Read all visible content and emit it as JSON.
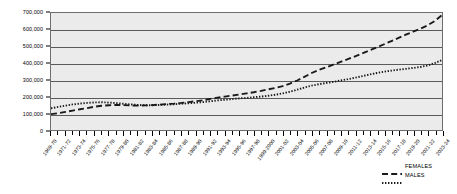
{
  "chart_data": {
    "type": "line",
    "title": "",
    "xlabel": "",
    "ylabel": "",
    "ylim": [
      0,
      700000
    ],
    "ytick_labels": [
      "0",
      "100,000",
      "200,000",
      "300,000",
      "400,000",
      "500,000",
      "600,000",
      "700,000"
    ],
    "ytick_values": [
      0,
      100000,
      200000,
      300000,
      400000,
      500000,
      600000,
      700000
    ],
    "grid": true,
    "legend_position": "bottom-right",
    "categories": [
      "1969-70",
      "1970-71",
      "1971-72",
      "1972-73",
      "1973-74",
      "1974-75",
      "1975-76",
      "1976-77",
      "1977-78",
      "1978-79",
      "1979-80",
      "1980-81",
      "1981-82",
      "1982-83",
      "1983-84",
      "1984-85",
      "1985-86",
      "1986-87",
      "1987-88",
      "1988-89",
      "1989-90",
      "1990-91",
      "1991-92",
      "1992-93",
      "1993-94",
      "1994-95",
      "1995-96",
      "1996-97",
      "1997-98",
      "1998-99",
      "1999-2000",
      "2000-01",
      "2001-02",
      "2002-03",
      "2003-04",
      "2004-05",
      "2005-06",
      "2006-07",
      "2007-08",
      "2008-09",
      "2009-10",
      "2010-11",
      "2011-12",
      "2012-13",
      "2013-14",
      "2014-15",
      "2015-16",
      "2016-17",
      "2017-18",
      "2018-19",
      "2019-20",
      "2020-21",
      "2021-22",
      "2022-23",
      "2023-24"
    ],
    "tick_labels": [
      "1969-70",
      "1971-72",
      "1973-74",
      "1975-76",
      "1977-78",
      "1979-80",
      "1981-82",
      "1983-84",
      "1985-86",
      "1987-88",
      "1989-90",
      "1991-92",
      "1993-94",
      "1995-96",
      "1997-98",
      "1999-2000",
      "2001-02",
      "2003-04",
      "2005-06",
      "2007-08",
      "2009-10",
      "2011-12",
      "2013-14",
      "2015-16",
      "2017-18",
      "2019-20",
      "2021-22",
      "2023-24"
    ],
    "series": [
      {
        "name": "FEMALES",
        "style": "dashed",
        "color": "#1a1a1a",
        "values": [
          95000,
          100000,
          108000,
          116000,
          124000,
          131000,
          139000,
          145000,
          148000,
          150000,
          149000,
          147000,
          146000,
          147000,
          149000,
          152000,
          155000,
          158000,
          162000,
          167000,
          172000,
          178000,
          186000,
          194000,
          200000,
          206000,
          212000,
          219000,
          226000,
          234000,
          243000,
          252000,
          263000,
          278000,
          296000,
          318000,
          341000,
          360000,
          375000,
          391000,
          408000,
          424000,
          441000,
          459000,
          477000,
          495000,
          513000,
          532000,
          551000,
          570000,
          588000,
          606000,
          626000,
          652000,
          688000
        ]
      },
      {
        "name": "MALES",
        "style": "dotted",
        "color": "#1a1a1a",
        "values": [
          130000,
          138000,
          146000,
          153000,
          158000,
          162000,
          165000,
          166000,
          164000,
          161000,
          157000,
          153000,
          150000,
          148000,
          148000,
          150000,
          152000,
          154000,
          157000,
          160000,
          163000,
          167000,
          172000,
          177000,
          181000,
          185000,
          189000,
          192000,
          196000,
          200000,
          205000,
          211000,
          219000,
          229000,
          241000,
          254000,
          266000,
          274000,
          281000,
          288000,
          296000,
          304000,
          313000,
          322000,
          332000,
          341000,
          349000,
          355000,
          361000,
          366000,
          371000,
          377000,
          386000,
          400000,
          419000
        ]
      }
    ]
  },
  "legend": {
    "items": [
      {
        "label": "FEMALES",
        "style": "dashed"
      },
      {
        "label": "MALES",
        "style": "dotted"
      }
    ]
  }
}
